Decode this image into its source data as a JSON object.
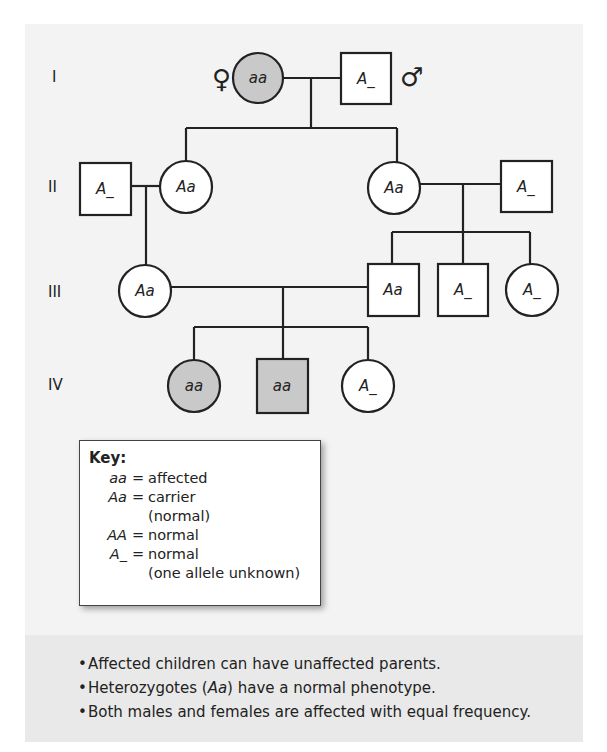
{
  "figure": {
    "type": "pedigree",
    "generation_labels": [
      "I",
      "II",
      "III",
      "IV"
    ],
    "sex_symbols": {
      "female": "♀",
      "male": "♂"
    },
    "colors": {
      "affected_fill": "#c9c9c9",
      "unaffected_fill": "#ffffff",
      "stroke": "#222222",
      "panel_bg": "#f3f3f3",
      "notes_bg": "#e9e9e9"
    },
    "individuals": {
      "I_1": {
        "sex": "female",
        "genotype": "aa",
        "affected": true
      },
      "I_2": {
        "sex": "male",
        "genotype": "A_",
        "affected": false
      },
      "II_1": {
        "sex": "male",
        "genotype": "A_",
        "affected": false
      },
      "II_2": {
        "sex": "female",
        "genotype": "Aa",
        "affected": false
      },
      "II_3": {
        "sex": "female",
        "genotype": "Aa",
        "affected": false
      },
      "II_4": {
        "sex": "male",
        "genotype": "A_",
        "affected": false
      },
      "III_1": {
        "sex": "female",
        "genotype": "Aa",
        "affected": false
      },
      "III_2": {
        "sex": "male",
        "genotype": "Aa",
        "affected": false
      },
      "III_3": {
        "sex": "male",
        "genotype": "A_",
        "affected": false
      },
      "III_4": {
        "sex": "female",
        "genotype": "A_",
        "affected": false
      },
      "IV_1": {
        "sex": "female",
        "genotype": "aa",
        "affected": true
      },
      "IV_2": {
        "sex": "male",
        "genotype": "aa",
        "affected": true
      },
      "IV_3": {
        "sex": "female",
        "genotype": "A_",
        "affected": false
      }
    }
  },
  "key": {
    "title": "Key:",
    "rows": [
      {
        "symbol": "aa",
        "eq": "=",
        "lines": [
          "affected"
        ]
      },
      {
        "symbol": "Aa",
        "eq": "=",
        "lines": [
          "carrier",
          "(normal)"
        ]
      },
      {
        "symbol": "AA",
        "eq": "=",
        "lines": [
          "normal"
        ]
      },
      {
        "symbol": "A_",
        "eq": "=",
        "lines": [
          "normal",
          "(one allele unknown)"
        ]
      }
    ]
  },
  "notes": {
    "bullet": "•",
    "items": [
      {
        "text": "Affected children can have unaffected parents."
      },
      {
        "pre": "Heterozygotes (",
        "ital": "Aa",
        "post": ") have a normal phenotype."
      },
      {
        "text": "Both males and females are affected with equal frequency."
      }
    ]
  }
}
